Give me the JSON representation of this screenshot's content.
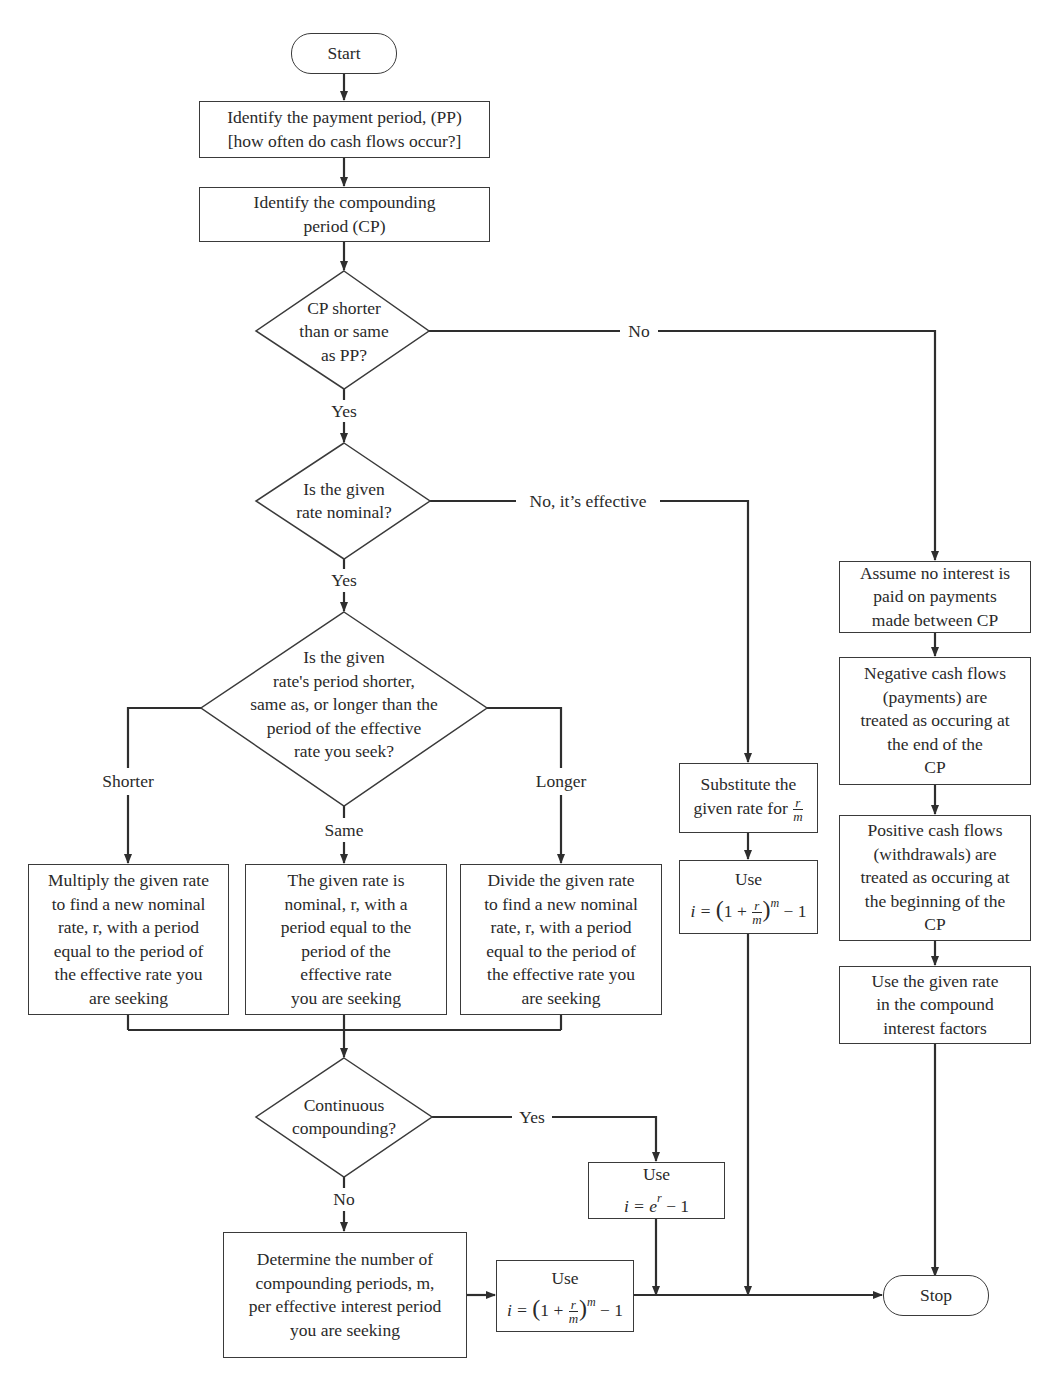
{
  "diagram": {
    "start": "Start",
    "stop": "Stop",
    "steps": {
      "identify_pp": [
        "Identify the payment period, (PP)",
        "[how often do cash flows occur?]"
      ],
      "identify_cp": [
        "Identify the compounding",
        "period (CP)"
      ],
      "assume_no_interest": [
        "Assume no interest is",
        "paid on payments",
        "made between CP"
      ],
      "negative_flows": [
        "Negative cash flows",
        "(payments) are",
        "treated as occuring at",
        "the end of the",
        "CP"
      ],
      "positive_flows": [
        "Positive cash flows",
        "(withdrawals) are",
        "treated as occuring at",
        "the beginning of the",
        "CP"
      ],
      "use_given_rate": [
        "Use the given rate",
        "in the compound",
        "interest factors"
      ],
      "substitute": {
        "line1": "Substitute the",
        "line2": "given rate for",
        "frac_num": "r",
        "frac_den": "m"
      },
      "use_formula_right": {
        "title": "Use",
        "lhs": "i = ",
        "one_plus": "1 + ",
        "frac_num": "r",
        "frac_den": "m",
        "exp": "m",
        "tail": " − 1"
      },
      "multiply": [
        "Multiply the given rate",
        "to find a new nominal",
        "rate, r, with a period",
        "equal to the period of",
        "the effective rate you",
        "are seeking"
      ],
      "same_nominal": [
        "The given rate is",
        "nominal, r, with a",
        "period equal to the",
        "period of the",
        "effective rate",
        "you are seeking"
      ],
      "divide": [
        "Divide the given rate",
        "to find a new nominal",
        "rate, r, with a period",
        "equal to the period of",
        "the effective rate you",
        "are seeking"
      ],
      "use_continuous": {
        "title": "Use",
        "lhs": "i = e",
        "exp": "r",
        "tail": " − 1"
      },
      "determine_m": [
        "Determine the number of",
        "compounding periods, m,",
        "per effective interest period",
        "you are seeking"
      ],
      "use_formula_bottom": {
        "title": "Use",
        "lhs": "i = ",
        "one_plus": "1 + ",
        "frac_num": "r",
        "frac_den": "m",
        "exp": "m",
        "tail": " − 1"
      }
    },
    "decisions": {
      "cp_vs_pp": [
        "CP shorter",
        "than or same",
        "as PP?"
      ],
      "nominal": [
        "Is the given",
        "rate nominal?"
      ],
      "period_compare": [
        "Is the given",
        "rate's period shorter,",
        "same as, or longer than the",
        "period of the effective",
        "rate you seek?"
      ],
      "continuous": [
        "Continuous",
        "compounding?"
      ]
    },
    "edge_labels": {
      "cp_no": "No",
      "cp_yes": "Yes",
      "nominal_no": "No, it’s effective",
      "nominal_yes": "Yes",
      "shorter": "Shorter",
      "same": "Same",
      "longer": "Longer",
      "continuous_yes": "Yes",
      "continuous_no": "No"
    },
    "colors": {
      "line": "#2e2e2e",
      "text": "#2a2a2a",
      "background": "#ffffff"
    }
  }
}
